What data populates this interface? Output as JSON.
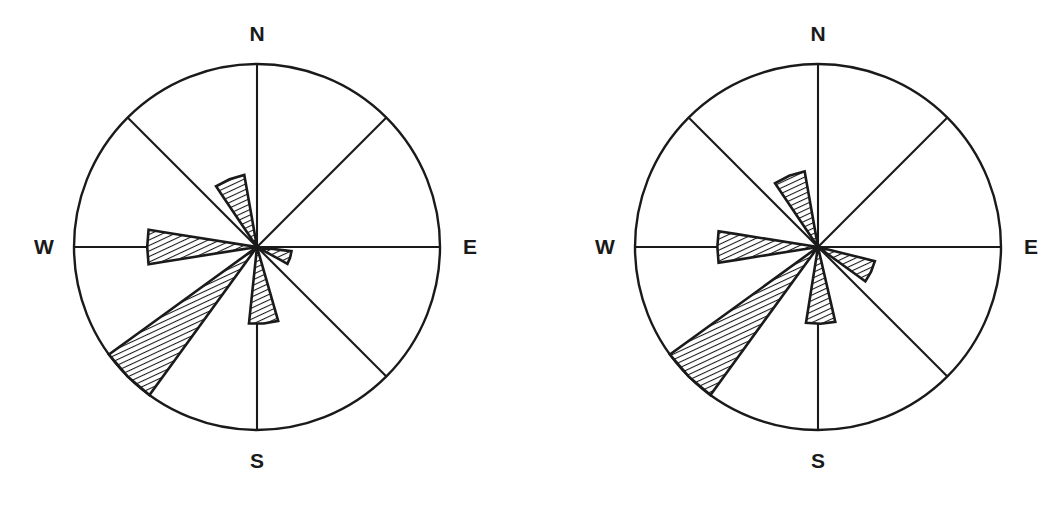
{
  "figure": {
    "title": "",
    "type": "paleocurrent-rose-diagram-pair",
    "background_color": "#ffffff",
    "line_color": "#1a1a1a"
  },
  "chart_data": {
    "type": "rose",
    "title": "",
    "subtitle": "",
    "xlabel": "",
    "ylabel": "",
    "grid": false,
    "legend_position": "none",
    "sector_count": 8,
    "sector_width_deg": 45,
    "compass_labels": [
      "N",
      "E",
      "S",
      "W"
    ],
    "radius_px": 183,
    "roses": [
      {
        "name": "rose-left",
        "center_x": 257,
        "center_y": 247,
        "radius": 183,
        "compass": {
          "north": "N",
          "east": "E",
          "south": "S",
          "west": "W"
        },
        "show_labels": [
          "N",
          "E",
          "S",
          "W"
        ],
        "petals": [
          {
            "name": "petal-nnw",
            "azimuth_deg": 338,
            "length_frac": 0.4,
            "half_width_deg": 12
          },
          {
            "name": "petal-w",
            "azimuth_deg": 270,
            "length_frac": 0.6,
            "half_width_deg": 9
          },
          {
            "name": "petal-sw",
            "azimuth_deg": 225,
            "length_frac": 1.0,
            "half_width_deg": 9
          },
          {
            "name": "petal-sse",
            "azimuth_deg": 175,
            "length_frac": 0.42,
            "half_width_deg": 11
          },
          {
            "name": "petal-ese",
            "azimuth_deg": 108,
            "length_frac": 0.19,
            "half_width_deg": 11
          }
        ]
      },
      {
        "name": "rose-right",
        "center_x": 818,
        "center_y": 247,
        "radius": 183,
        "compass": {
          "north": "N",
          "east": "E",
          "south": "S",
          "west": "W"
        },
        "show_labels": [
          "N",
          "E",
          "S",
          "W"
        ],
        "petals": [
          {
            "name": "petal-nnw",
            "azimuth_deg": 338,
            "length_frac": 0.42,
            "half_width_deg": 12
          },
          {
            "name": "petal-w",
            "azimuth_deg": 270,
            "length_frac": 0.55,
            "half_width_deg": 9
          },
          {
            "name": "petal-sw",
            "azimuth_deg": 225,
            "length_frac": 1.0,
            "half_width_deg": 9
          },
          {
            "name": "petal-sse",
            "azimuth_deg": 178,
            "length_frac": 0.42,
            "half_width_deg": 11
          },
          {
            "name": "petal-ese",
            "azimuth_deg": 115,
            "length_frac": 0.32,
            "half_width_deg": 11
          }
        ]
      }
    ],
    "labels": {
      "left_N": "N",
      "left_E": "E",
      "left_S": "S",
      "left_W": "W",
      "right_N": "N",
      "right_E": "E",
      "right_S": "S",
      "right_W": "W"
    }
  }
}
